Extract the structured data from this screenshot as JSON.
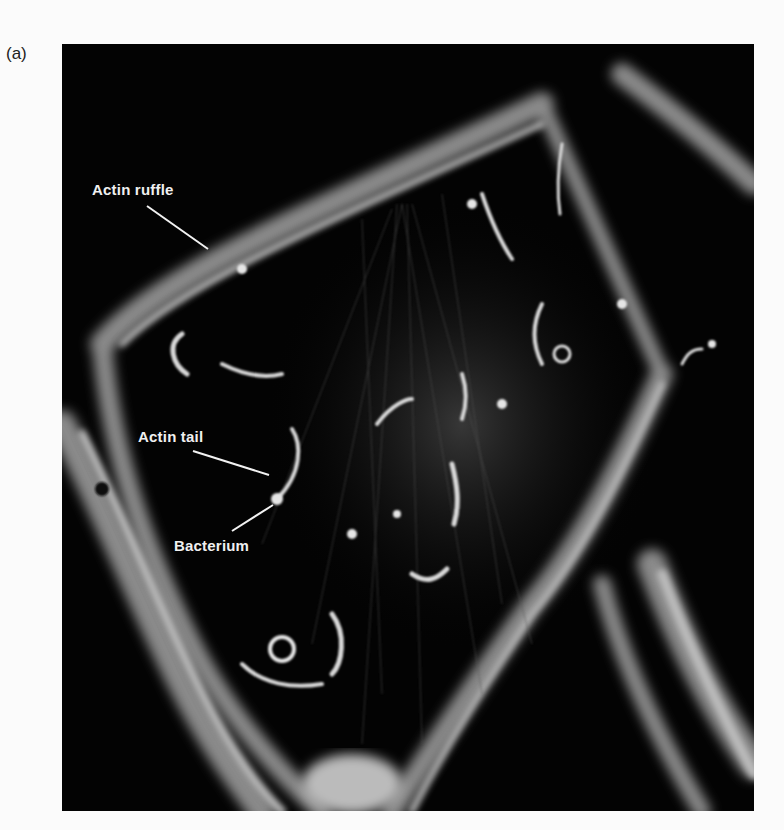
{
  "panel": {
    "label": "(a)"
  },
  "figure": {
    "annotations": [
      {
        "id": "actin-ruffle",
        "text": "Actin ruffle"
      },
      {
        "id": "actin-tail",
        "text": "Actin tail"
      },
      {
        "id": "bacterium",
        "text": "Bacterium"
      }
    ]
  }
}
